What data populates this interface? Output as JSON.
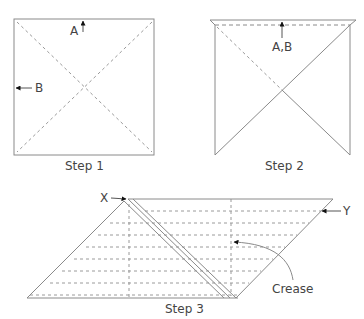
{
  "colors": {
    "line": "#8a8a8a",
    "dash": "#9a9a9a",
    "text": "#444444",
    "arrow": "#111111",
    "background": "#ffffff"
  },
  "steps": [
    {
      "id": "step1",
      "caption": "Step 1",
      "labels": {
        "a": "A",
        "b": "B"
      }
    },
    {
      "id": "step2",
      "caption": "Step 2",
      "labels": {
        "ab": "A,B"
      }
    },
    {
      "id": "step3",
      "caption": "Step 3",
      "labels": {
        "x": "X",
        "y": "Y",
        "crease": "Crease"
      }
    }
  ]
}
